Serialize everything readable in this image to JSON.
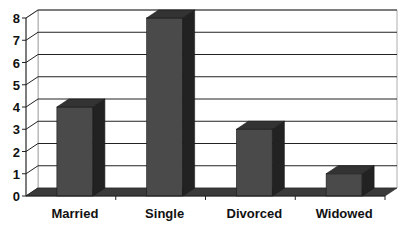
{
  "chart_data": {
    "type": "bar",
    "style": "3d-column",
    "title": "",
    "xlabel": "",
    "ylabel": "",
    "categories": [
      "Married",
      "Single",
      "Divorced",
      "Widowed"
    ],
    "values": [
      4,
      8,
      3,
      1
    ],
    "ylim": [
      0,
      8
    ],
    "yticks": [
      0,
      1,
      2,
      3,
      4,
      5,
      6,
      7,
      8
    ],
    "grid": true,
    "legend": null
  },
  "colors": {
    "bar_front": "#4a4a4a",
    "bar_top": "#333333",
    "bar_side": "#222222",
    "floor": "#3a3a3a",
    "grid": "#222222",
    "background": "#ffffff"
  }
}
